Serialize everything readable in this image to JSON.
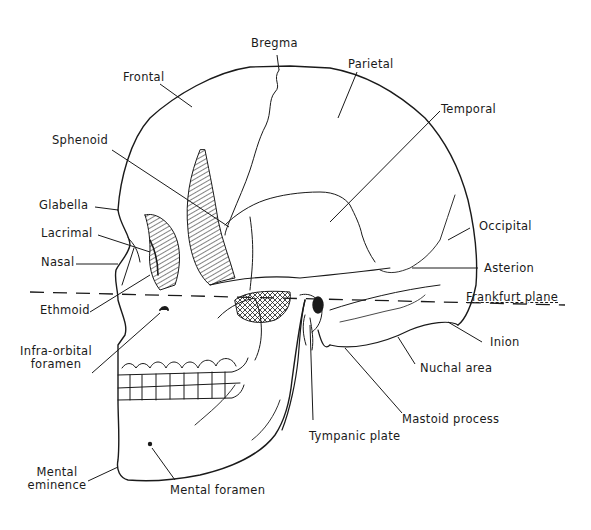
{
  "figure": {
    "labels": {
      "bregma": "Bregma",
      "frontal": "Frontal",
      "parietal": "Parietal",
      "temporal": "Temporal",
      "sphenoid": "Sphenoid",
      "glabella": "Glabella",
      "lacrimal": "Lacrimal",
      "nasal": "Nasal",
      "occipital": "Occipital",
      "asterion": "Asterion",
      "frankfurt_plane": "Frankfurt plane",
      "ethmoid": "Ethmoid",
      "inion": "Inion",
      "infra_orbital_1": "Infra-orbital",
      "infra_orbital_2": "foramen",
      "nuchal_area": "Nuchal area",
      "mastoid_process": "Mastoid process",
      "tympanic_plate": "Tympanic plate",
      "mental_eminence_1": "Mental",
      "mental_eminence_2": "eminence",
      "mental_foramen": "Mental foramen"
    },
    "colors": {
      "line": "#1a1a1a",
      "background": "#ffffff"
    }
  }
}
